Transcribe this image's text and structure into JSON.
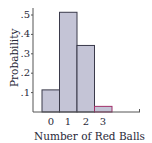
{
  "chart_data": {
    "type": "bar",
    "title": "",
    "xlabel": "Number of Red Balls",
    "ylabel": "Probability",
    "categories": [
      "0",
      "1",
      "2",
      "3"
    ],
    "values": [
      0.114,
      0.514,
      0.343,
      0.029
    ],
    "yticks": [
      ".1",
      ".2",
      ".3",
      ".4",
      ".5"
    ],
    "ylim": [
      0,
      0.55
    ],
    "grid": false,
    "legend": null,
    "bar_color": "#c4c4d6",
    "bar_edge_color": "#3a3a4a",
    "highlight_edge_color": "#a0306a"
  }
}
